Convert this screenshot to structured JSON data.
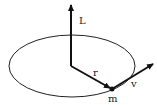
{
  "diagram": {
    "labels": {
      "angular_momentum": "L",
      "radius": "r",
      "velocity": "v",
      "mass": "m"
    },
    "colors": {
      "stroke": "#111111",
      "background": "#ffffff"
    },
    "elements": [
      {
        "type": "ellipse",
        "name": "orbit",
        "cx": 72,
        "cy": 66,
        "rx": 63,
        "ry": 31
      },
      {
        "type": "arrow",
        "name": "L-vector",
        "from": [
          71,
          66
        ],
        "to": [
          71,
          3
        ]
      },
      {
        "type": "arrow",
        "name": "r-vector",
        "from": [
          71,
          66
        ],
        "to": [
          112,
          89
        ]
      },
      {
        "type": "arrow",
        "name": "v-vector",
        "from": [
          112,
          89
        ],
        "to": [
          155,
          63
        ]
      },
      {
        "type": "point",
        "name": "mass-point",
        "at": [
          112,
          90
        ]
      }
    ]
  }
}
